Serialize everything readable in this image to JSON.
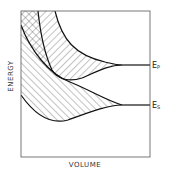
{
  "diagram": {
    "xlabel": "VOLUME",
    "ylabel": "ENERGY",
    "curves": [
      {
        "name": "Ep",
        "main": "E",
        "sub": "P"
      },
      {
        "name": "Es",
        "main": "E",
        "sub": "S"
      }
    ]
  }
}
